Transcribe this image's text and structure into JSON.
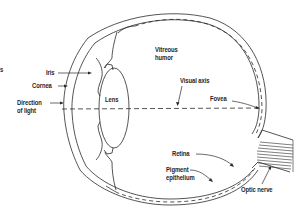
{
  "diagram": {
    "colors": {
      "stroke": "#2a2a2a",
      "text": "#1f1f1f",
      "background": "#ffffff"
    },
    "labels": {
      "edge_fragment": "s",
      "iris": "Iris",
      "cornea": "Cornea",
      "direction_of_light_line1": "Direction",
      "direction_of_light_line2": "of light",
      "lens": "Lens",
      "vitreous_humor_line1": "Vitreous",
      "vitreous_humor_line2": "humor",
      "visual_axis": "Visual axis",
      "fovea": "Fovea",
      "retina": "Retina",
      "pigment_epithelium_line1": "Pigment",
      "pigment_epithelium_line2": "epithelium",
      "optic_nerve": "Optic nerve"
    }
  }
}
